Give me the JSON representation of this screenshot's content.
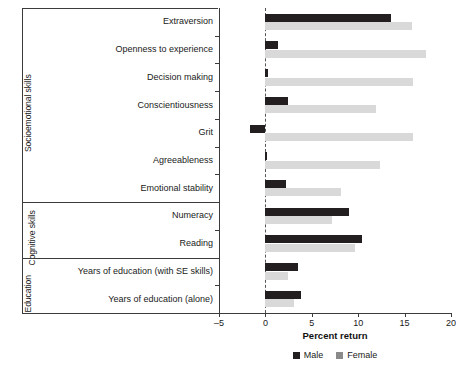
{
  "chart_data": {
    "type": "bar",
    "orientation": "horizontal",
    "title": "",
    "xlabel": "Percent return",
    "ylabel": "",
    "xlim": [
      -5,
      20
    ],
    "xticks": [
      -5,
      0,
      5,
      10,
      15,
      20
    ],
    "xticklabels": [
      "–5",
      "0",
      "5",
      "10",
      "15",
      "20"
    ],
    "grid": false,
    "zero_reference_line": true,
    "legend": {
      "position": "bottom-center",
      "entries": [
        {
          "name": "Male",
          "color": "#231f20"
        },
        {
          "name": "Female",
          "color": "#d9d9d9"
        }
      ]
    },
    "categories": [
      "Extraversion",
      "Openness to experience",
      "Decision making",
      "Conscientiousness",
      "Grit",
      "Agreeableness",
      "Emotional stability",
      "Numeracy",
      "Reading",
      "Years of education (with SE skills)",
      "Years of education (alone)"
    ],
    "series": [
      {
        "name": "Male",
        "color": "#231f20",
        "values": [
          13.5,
          1.4,
          0.3,
          2.4,
          -1.7,
          0.05,
          2.2,
          9.0,
          10.4,
          3.5,
          3.8
        ]
      },
      {
        "name": "Female",
        "color": "#d9d9d9",
        "values": [
          15.8,
          17.3,
          15.9,
          11.9,
          15.9,
          12.4,
          8.1,
          7.2,
          9.7,
          2.4,
          3.1
        ]
      }
    ],
    "groups": [
      {
        "label": "Socioemotional skills",
        "categories": 7
      },
      {
        "label": "Cognitive skills",
        "categories": 2
      },
      {
        "label": "Education",
        "categories": 2
      }
    ]
  }
}
